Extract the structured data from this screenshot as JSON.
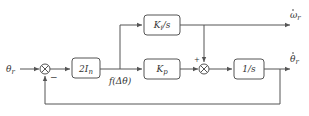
{
  "diagram": {
    "input_label": "θ_r",
    "input_main": "θ",
    "input_sub": "r",
    "blocks": [
      {
        "id": "gain",
        "main": "2I",
        "sub": "n"
      },
      {
        "id": "integral",
        "main": "K",
        "sub": "i",
        "tail": "/s"
      },
      {
        "id": "proportional",
        "main": "K",
        "sub": "p"
      },
      {
        "id": "integrator",
        "main": "1/s"
      }
    ],
    "signal_label": "f(Δθ)",
    "summer1_minus": "−",
    "summer2_plus": "+",
    "output_top_main": "ω",
    "output_top_sub": "r",
    "output_bottom_main": "θ",
    "output_bottom_sub": "r",
    "line_color": "#555555"
  }
}
